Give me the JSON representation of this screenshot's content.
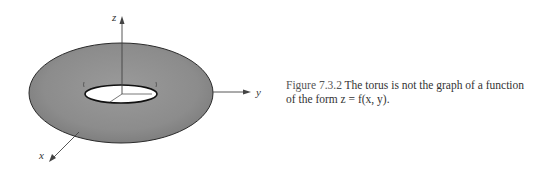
{
  "figure": {
    "axes": {
      "z": "z",
      "y": "y",
      "x": "x"
    },
    "colors": {
      "torus_fill": "#8f8f8f",
      "torus_edge": "#2a2a2a",
      "hole": "#ffffff",
      "axis": "#444444"
    }
  },
  "caption": {
    "label": "Figure 7.3.2",
    "text": "The torus is not the graph of a function of the form z = f(x, y)."
  }
}
